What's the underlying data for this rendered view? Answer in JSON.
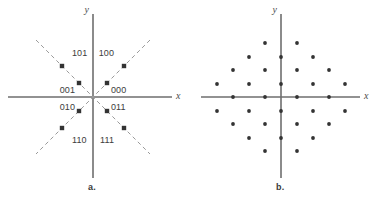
{
  "figure": {
    "width": 384,
    "height": 201,
    "background": "#ffffff",
    "axis_color": "#6e6e6e",
    "dash_color": "#9a9a9a",
    "dot_color": "#333333",
    "text_color": "#3c3c3c"
  },
  "panel_a": {
    "caption": "a.",
    "origin": {
      "x": 93,
      "y": 97
    },
    "x_axis_label": "x",
    "y_axis_label": "y",
    "x_axis": {
      "x1": 8,
      "x2": 172,
      "y": 97
    },
    "y_axis": {
      "y1": 14,
      "y2": 178,
      "x": 93
    },
    "x_label_pos": {
      "x": 176,
      "y": 99
    },
    "y_label_pos": {
      "x": 89,
      "y": 13
    },
    "dash_lines": [
      {
        "x1": 36,
        "y1": 40,
        "x2": 150,
        "y2": 154
      },
      {
        "x1": 150,
        "y1": 40,
        "x2": 36,
        "y2": 154
      }
    ],
    "points": [
      {
        "label": "101",
        "x": 62,
        "y": 66,
        "lx": 72,
        "ly": 56,
        "anchor": "start"
      },
      {
        "label": "100",
        "x": 124,
        "y": 66,
        "lx": 114,
        "ly": 56,
        "anchor": "end"
      },
      {
        "label": "001",
        "x": 79,
        "y": 83,
        "lx": 75,
        "ly": 93,
        "anchor": "end"
      },
      {
        "label": "000",
        "x": 107,
        "y": 83,
        "lx": 111,
        "ly": 93,
        "anchor": "start"
      },
      {
        "label": "010",
        "x": 79,
        "y": 111,
        "lx": 75,
        "ly": 110,
        "anchor": "end"
      },
      {
        "label": "011",
        "x": 107,
        "y": 111,
        "lx": 111,
        "ly": 110,
        "anchor": "start"
      },
      {
        "label": "110",
        "x": 62,
        "y": 128,
        "lx": 72,
        "ly": 143,
        "anchor": "start"
      },
      {
        "label": "111",
        "x": 124,
        "y": 128,
        "lx": 114,
        "ly": 143,
        "anchor": "end"
      }
    ],
    "caption_pos": {
      "x": 88,
      "y": 182
    }
  },
  "panel_b": {
    "caption": "b.",
    "origin": {
      "x": 281,
      "y": 97
    },
    "x_axis_label": "x",
    "y_axis_label": "y",
    "x_axis": {
      "x1": 201,
      "x2": 360,
      "y": 97
    },
    "y_axis": {
      "y1": 14,
      "y2": 178,
      "x": 281
    },
    "x_label_pos": {
      "x": 364,
      "y": 99
    },
    "y_label_pos": {
      "x": 277,
      "y": 13
    },
    "caption_pos": {
      "x": 276,
      "y": 182
    },
    "lattice": {
      "type": "hexagonal",
      "dx": 16,
      "dy": 13.5,
      "point_radius": 1.9,
      "point_count": 37
    },
    "points": [
      {
        "x": 265,
        "y": 43
      },
      {
        "x": 297,
        "y": 43
      },
      {
        "x": 249,
        "y": 57
      },
      {
        "x": 281,
        "y": 57
      },
      {
        "x": 313,
        "y": 57
      },
      {
        "x": 233,
        "y": 70
      },
      {
        "x": 265,
        "y": 70
      },
      {
        "x": 297,
        "y": 70
      },
      {
        "x": 329,
        "y": 70
      },
      {
        "x": 217,
        "y": 84
      },
      {
        "x": 249,
        "y": 84
      },
      {
        "x": 281,
        "y": 84
      },
      {
        "x": 313,
        "y": 84
      },
      {
        "x": 345,
        "y": 84
      },
      {
        "x": 233,
        "y": 97
      },
      {
        "x": 265,
        "y": 97
      },
      {
        "x": 297,
        "y": 97
      },
      {
        "x": 329,
        "y": 97
      },
      {
        "x": 217,
        "y": 111
      },
      {
        "x": 249,
        "y": 111
      },
      {
        "x": 281,
        "y": 111
      },
      {
        "x": 313,
        "y": 111
      },
      {
        "x": 345,
        "y": 111
      },
      {
        "x": 233,
        "y": 124
      },
      {
        "x": 265,
        "y": 124
      },
      {
        "x": 297,
        "y": 124
      },
      {
        "x": 329,
        "y": 124
      },
      {
        "x": 249,
        "y": 138
      },
      {
        "x": 281,
        "y": 138
      },
      {
        "x": 313,
        "y": 138
      },
      {
        "x": 265,
        "y": 151
      },
      {
        "x": 297,
        "y": 151
      }
    ]
  },
  "chart_data": {
    "type": "scatter",
    "title": "",
    "xlabel": "x",
    "ylabel": "y",
    "grid": false,
    "legend": "none",
    "series": [
      {
        "name": "a. 8-point diagonal constellation with Gray-coded labels",
        "labels": [
          "101",
          "100",
          "001",
          "000",
          "010",
          "011",
          "110",
          "111"
        ],
        "x": [
          -2.0,
          2.0,
          -1.0,
          1.0,
          -1.0,
          1.0,
          -2.0,
          2.0
        ],
        "y": [
          2.0,
          2.0,
          1.0,
          1.0,
          -1.0,
          -1.0,
          -2.0,
          -2.0
        ]
      },
      {
        "name": "b. hexagonal (triangular) lattice constellation",
        "x": [
          -1,
          1,
          -2,
          0,
          2,
          -3,
          -1,
          1,
          3,
          -4,
          -2,
          0,
          2,
          4,
          -3,
          -1,
          1,
          3,
          -4,
          -2,
          0,
          2,
          4,
          -3,
          -1,
          1,
          3,
          -2,
          0,
          2,
          -1,
          1
        ],
        "y": [
          4,
          4,
          3,
          3,
          3,
          2,
          2,
          2,
          2,
          1,
          1,
          1,
          1,
          1,
          0,
          0,
          0,
          0,
          -1,
          -1,
          -1,
          -1,
          -1,
          -2,
          -2,
          -2,
          -2,
          -3,
          -3,
          -3,
          -4,
          -4
        ]
      }
    ]
  }
}
